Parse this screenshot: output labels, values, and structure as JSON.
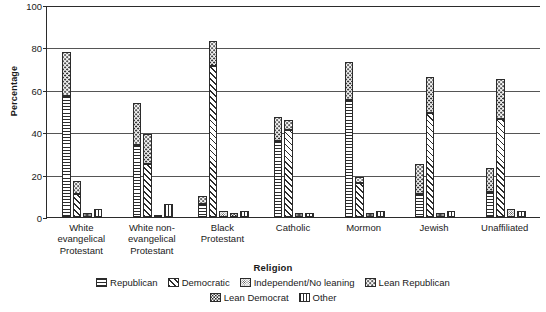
{
  "chart_data": {
    "type": "bar",
    "title": "",
    "xlabel": "Religion",
    "ylabel": "Percentage",
    "ylim": [
      0,
      100
    ],
    "yticks": [
      0,
      20,
      40,
      60,
      80,
      100
    ],
    "grid": true,
    "legend_position": "bottom",
    "categories": [
      "White\nevangelical\nProtestant",
      "White non-\nevangelical\nProtestant",
      "Black\nProtestant",
      "Catholic",
      "Mormon",
      "Jewish",
      "Unaffiliated"
    ],
    "series": [
      {
        "name": "Republican",
        "pattern": "hlines",
        "values": [
          57,
          34,
          7,
          36,
          55,
          11,
          12
        ]
      },
      {
        "name": "Democratic",
        "pattern": "diag",
        "values": [
          11,
          25,
          71,
          41,
          16,
          49,
          46
        ]
      },
      {
        "name": "Independent/No leaning",
        "pattern": "dense-dots",
        "values": [
          2,
          1,
          3,
          2,
          2,
          2,
          4
        ]
      },
      {
        "name": "Lean Republican",
        "pattern": "sparse-dots",
        "values": [
          21,
          20,
          5,
          11,
          18,
          13,
          11
        ]
      },
      {
        "name": "Lean Democrat",
        "pattern": "fine-dots",
        "values": [
          2,
          1,
          2,
          2,
          2,
          2,
          3
        ]
      },
      {
        "name": "Other",
        "pattern": "vlines",
        "values": [
          4,
          6,
          3,
          2,
          3,
          3,
          3
        ]
      }
    ],
    "stacks": [
      {
        "category": "White\nevangelical\nProtestant",
        "bars": [
          {
            "series": "Republican",
            "total": 78,
            "segments": [
              {
                "pattern": "sparse-dots",
                "from": 57,
                "to": 78
              },
              {
                "pattern": "hlines",
                "from": 0,
                "to": 57
              }
            ]
          },
          {
            "series": "Democratic",
            "total": 17,
            "segments": [
              {
                "pattern": "sparse-dots",
                "from": 11,
                "to": 17
              },
              {
                "pattern": "diag",
                "from": 0,
                "to": 11
              }
            ]
          },
          {
            "series": "Independent/No leaning",
            "total": 2,
            "segments": [
              {
                "pattern": "dense-dots",
                "from": 0,
                "to": 2
              }
            ]
          },
          {
            "series": "Other",
            "total": 4,
            "segments": [
              {
                "pattern": "vlines",
                "from": 0,
                "to": 4
              }
            ]
          }
        ]
      },
      {
        "category": "White non-\nevangelical\nProtestant",
        "bars": [
          {
            "series": "Republican",
            "total": 54,
            "segments": [
              {
                "pattern": "sparse-dots",
                "from": 34,
                "to": 54
              },
              {
                "pattern": "hlines",
                "from": 0,
                "to": 34
              }
            ]
          },
          {
            "series": "Democratic",
            "total": 39,
            "segments": [
              {
                "pattern": "sparse-dots",
                "from": 25,
                "to": 39
              },
              {
                "pattern": "diag",
                "from": 0,
                "to": 25
              }
            ]
          },
          {
            "series": "Independent/No leaning",
            "total": 1,
            "segments": [
              {
                "pattern": "dense-dots",
                "from": 0,
                "to": 1
              }
            ]
          },
          {
            "series": "Other",
            "total": 6,
            "segments": [
              {
                "pattern": "vlines",
                "from": 0,
                "to": 6
              }
            ]
          }
        ]
      },
      {
        "category": "Black\nProtestant",
        "bars": [
          {
            "series": "Republican",
            "total": 10,
            "segments": [
              {
                "pattern": "sparse-dots",
                "from": 6,
                "to": 10
              },
              {
                "pattern": "hlines",
                "from": 0,
                "to": 6
              }
            ]
          },
          {
            "series": "Democratic",
            "total": 83,
            "segments": [
              {
                "pattern": "sparse-dots",
                "from": 71,
                "to": 83
              },
              {
                "pattern": "diag",
                "from": 0,
                "to": 71
              }
            ]
          },
          {
            "series": "Independent/No leaning",
            "total": 3,
            "segments": [
              {
                "pattern": "dense-dots",
                "from": 0,
                "to": 3
              }
            ]
          },
          {
            "series": "Lean Democrat",
            "total": 2,
            "segments": [
              {
                "pattern": "fine-dots",
                "from": 0,
                "to": 2
              }
            ]
          },
          {
            "series": "Other",
            "total": 3,
            "segments": [
              {
                "pattern": "vlines",
                "from": 0,
                "to": 3
              }
            ]
          }
        ]
      },
      {
        "category": "Catholic",
        "bars": [
          {
            "series": "Republican",
            "total": 47,
            "segments": [
              {
                "pattern": "sparse-dots",
                "from": 36,
                "to": 47
              },
              {
                "pattern": "hlines",
                "from": 0,
                "to": 36
              }
            ]
          },
          {
            "series": "Democratic",
            "total": 46,
            "segments": [
              {
                "pattern": "sparse-dots",
                "from": 41,
                "to": 46
              },
              {
                "pattern": "diag",
                "from": 0,
                "to": 41
              }
            ]
          },
          {
            "series": "Independent/No leaning",
            "total": 2,
            "segments": [
              {
                "pattern": "dense-dots",
                "from": 0,
                "to": 2
              }
            ]
          },
          {
            "series": "Other",
            "total": 2,
            "segments": [
              {
                "pattern": "vlines",
                "from": 0,
                "to": 2
              }
            ]
          }
        ]
      },
      {
        "category": "Mormon",
        "bars": [
          {
            "series": "Republican",
            "total": 73,
            "segments": [
              {
                "pattern": "sparse-dots",
                "from": 55,
                "to": 73
              },
              {
                "pattern": "hlines",
                "from": 0,
                "to": 55
              }
            ]
          },
          {
            "series": "Democratic",
            "total": 19,
            "segments": [
              {
                "pattern": "sparse-dots",
                "from": 16,
                "to": 19
              },
              {
                "pattern": "diag",
                "from": 0,
                "to": 16
              }
            ]
          },
          {
            "series": "Independent/No leaning",
            "total": 2,
            "segments": [
              {
                "pattern": "dense-dots",
                "from": 0,
                "to": 2
              }
            ]
          },
          {
            "series": "Other",
            "total": 3,
            "segments": [
              {
                "pattern": "vlines",
                "from": 0,
                "to": 3
              }
            ]
          }
        ]
      },
      {
        "category": "Jewish",
        "bars": [
          {
            "series": "Republican",
            "total": 25,
            "segments": [
              {
                "pattern": "sparse-dots",
                "from": 11,
                "to": 25
              },
              {
                "pattern": "hlines",
                "from": 0,
                "to": 11
              }
            ]
          },
          {
            "series": "Democratic",
            "total": 66,
            "segments": [
              {
                "pattern": "sparse-dots",
                "from": 49,
                "to": 66
              },
              {
                "pattern": "diag",
                "from": 0,
                "to": 49
              }
            ]
          },
          {
            "series": "Independent/No leaning",
            "total": 2,
            "segments": [
              {
                "pattern": "dense-dots",
                "from": 0,
                "to": 2
              }
            ]
          },
          {
            "series": "Other",
            "total": 3,
            "segments": [
              {
                "pattern": "vlines",
                "from": 0,
                "to": 3
              }
            ]
          }
        ]
      },
      {
        "category": "Unaffiliated",
        "bars": [
          {
            "series": "Republican",
            "total": 23,
            "segments": [
              {
                "pattern": "sparse-dots",
                "from": 12,
                "to": 23
              },
              {
                "pattern": "hlines",
                "from": 0,
                "to": 12
              }
            ]
          },
          {
            "series": "Democratic",
            "total": 65,
            "segments": [
              {
                "pattern": "sparse-dots",
                "from": 46,
                "to": 65
              },
              {
                "pattern": "diag",
                "from": 0,
                "to": 46
              }
            ]
          },
          {
            "series": "Independent/No leaning",
            "total": 4,
            "segments": [
              {
                "pattern": "dense-dots",
                "from": 0,
                "to": 4
              }
            ]
          },
          {
            "series": "Other",
            "total": 3,
            "segments": [
              {
                "pattern": "vlines",
                "from": 0,
                "to": 3
              }
            ]
          }
        ]
      }
    ],
    "legend": {
      "row1": [
        "Republican",
        "Democratic",
        "Independent/No leaning",
        "Lean Republican"
      ],
      "row2": [
        "Lean Democrat",
        "Other"
      ]
    },
    "colors": {
      "ink": "#2b2b2b",
      "background": "#ffffff",
      "gridline": "#555555"
    }
  }
}
